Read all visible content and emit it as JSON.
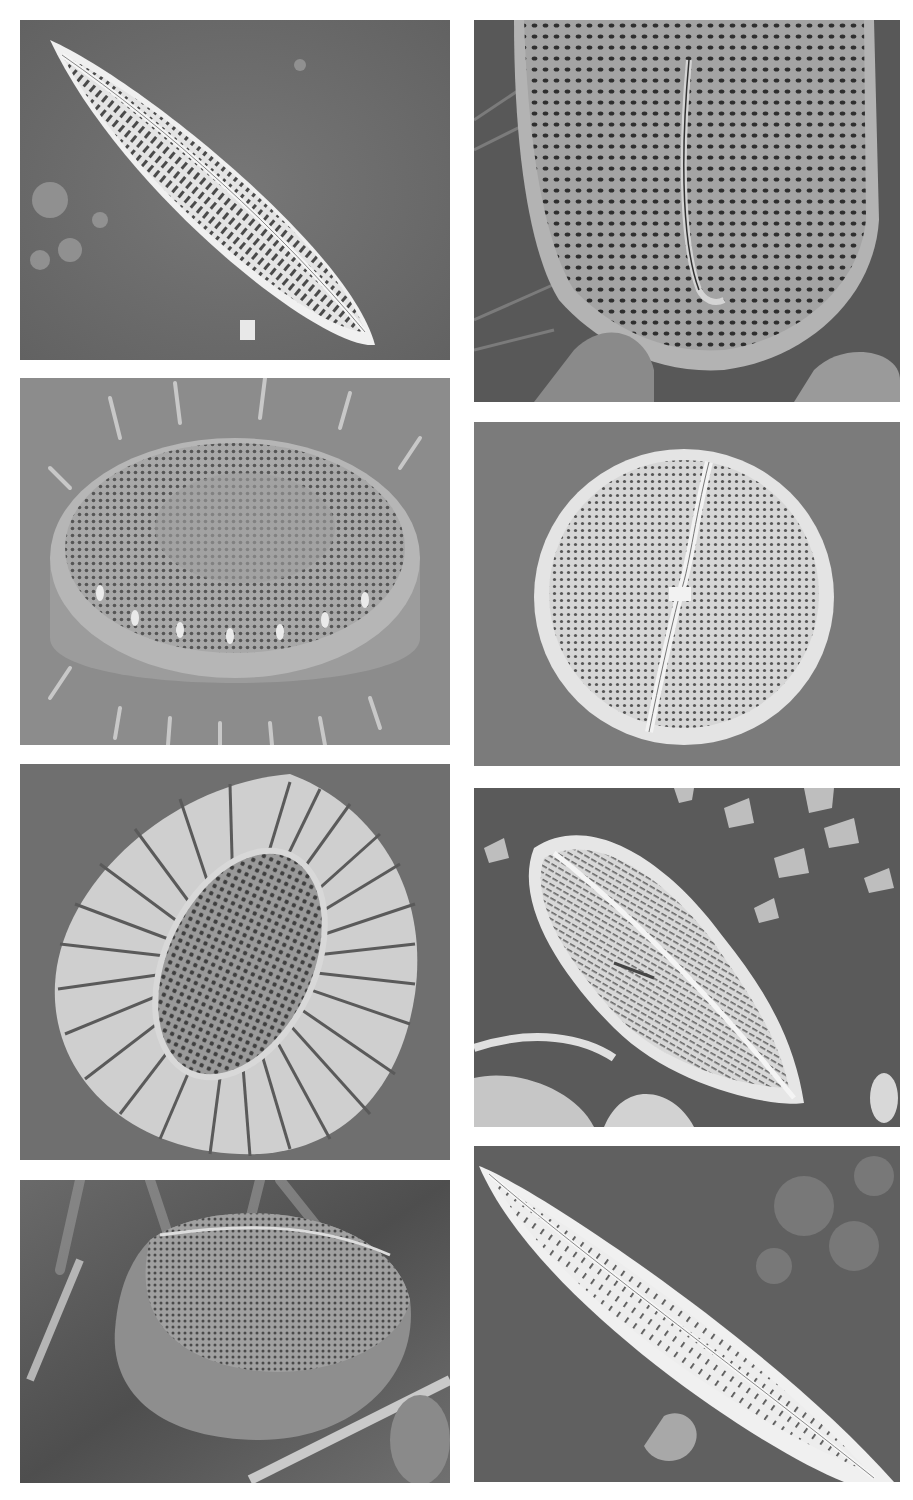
{
  "figure": {
    "background": "#ffffff",
    "panels": [
      {
        "id": "L1",
        "column": "left",
        "row": 1,
        "subject": "elongate lanceolate pennate diatom valve with a central raphe and transverse rows of areolae, lying diagonally on a substrate with debris",
        "x": 20,
        "y": 20,
        "w": 430,
        "h": 340,
        "bg": "#6e6e6e",
        "fg": "#dcdcdc"
      },
      {
        "id": "L2",
        "column": "left",
        "row": 2,
        "subject": "cylindrical centric diatom with a ring of marginal spines and a deeply punctate valve face, seen obliquely",
        "x": 20,
        "y": 378,
        "w": 430,
        "h": 367,
        "bg": "#8a8a8a",
        "fg": "#bdbdbd"
      },
      {
        "id": "L3",
        "column": "left",
        "row": 3,
        "subject": "rhomboid valve with radiating striae around a central punctate area",
        "x": 20,
        "y": 764,
        "w": 430,
        "h": 396,
        "bg": "#6f6f6f",
        "fg": "#c9c9c9"
      },
      {
        "id": "L4",
        "column": "left",
        "row": 4,
        "subject": "oval raphid diatom in girdle view with a punctate valve face on fibrous substrate",
        "x": 20,
        "y": 1180,
        "w": 430,
        "h": 303,
        "bg": "#5e5e5e",
        "fg": "#b0b0b0"
      },
      {
        "id": "R1",
        "column": "right",
        "row": 1,
        "subject": "close-up of a valve apex showing dense areolae and a curved raphe with terminal fissure",
        "x": 474,
        "y": 20,
        "w": 426,
        "h": 382,
        "bg": "#555555",
        "fg": "#a9a9a9"
      },
      {
        "id": "R2",
        "column": "right",
        "row": 2,
        "subject": "circular raphid valve with a straight raphe and central nodule, densely punctate",
        "x": 474,
        "y": 422,
        "w": 426,
        "h": 344,
        "bg": "#7b7b7b",
        "fg": "#d6d6d6"
      },
      {
        "id": "R3",
        "column": "right",
        "row": 3,
        "subject": "asymmetric cymbelloid valve with striae and small secondary diatom fragment among debris",
        "x": 474,
        "y": 788,
        "w": 426,
        "h": 339,
        "bg": "#5a5a5a",
        "fg": "#d0d0d0"
      },
      {
        "id": "R4",
        "column": "right",
        "row": 4,
        "subject": "long lanceolate naviculoid valve with raphe and rows of elongated areolae on a dark substrate",
        "x": 474,
        "y": 1146,
        "w": 426,
        "h": 336,
        "bg": "#5f5f5f",
        "fg": "#e6e6e6"
      }
    ]
  }
}
